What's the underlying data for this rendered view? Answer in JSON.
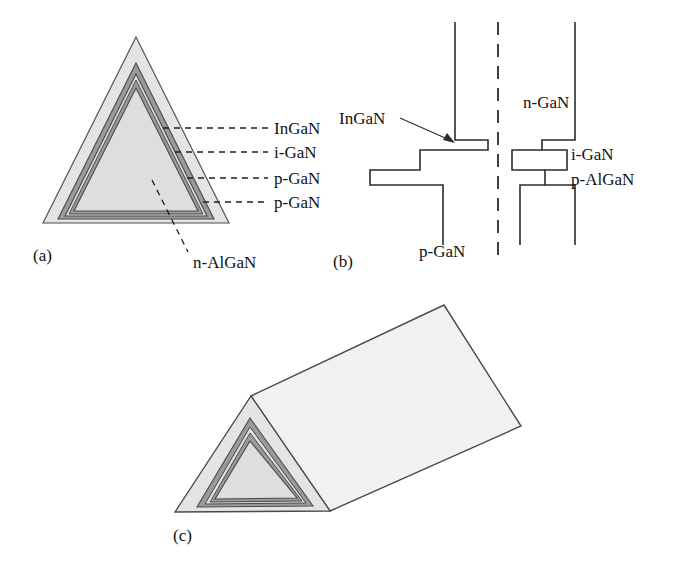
{
  "figure": {
    "background": "#ffffff",
    "colors": {
      "outline": "#3b3b3b",
      "light_gray": "#e2e2e2",
      "mid_gray": "#d2d2d2",
      "dark_gray": "#8f8f8f",
      "core_gray": "#dcdcdc",
      "text": "#121212",
      "prism_face": "#ededed",
      "prism_top": "#f0f0f0"
    }
  },
  "panels": [
    {
      "id": "a",
      "label": "(a)",
      "type": "nested-triangle-cross-section",
      "description": "Plan-view of concentric epitaxial layers on a triangular mesa",
      "layers": [
        {
          "name": "n-AlGaN",
          "shade": "light_gray"
        },
        {
          "name": "p-GaN",
          "shade": "dark_gray"
        },
        {
          "name": "p-GaN",
          "shade": "mid_gray"
        },
        {
          "name": "i-GaN",
          "shade": "light_gray"
        },
        {
          "name": "InGaN",
          "shade": "core_gray"
        }
      ],
      "callouts": [
        {
          "text": "InGaN",
          "leader": "dashed-horizontal"
        },
        {
          "text": "i-GaN",
          "leader": "dashed-horizontal"
        },
        {
          "text": "p-GaN",
          "leader": "dashed-horizontal"
        },
        {
          "text": "p-GaN",
          "leader": "dashed-horizontal"
        },
        {
          "text": "n-AlGaN",
          "leader": "dashed-diagonal"
        }
      ]
    },
    {
      "id": "b",
      "label": "(b)",
      "type": "stepped-cross-section",
      "description": "Mirror-symmetric stepped layer profile about a dash-dot centerline",
      "callouts": [
        {
          "text": "InGaN",
          "leader": "arrow",
          "side": "left"
        },
        {
          "text": "p-GaN",
          "leader": "none",
          "side": "left"
        },
        {
          "text": "n-GaN",
          "leader": "none",
          "side": "right"
        },
        {
          "text": "i-GaN",
          "leader": "none",
          "side": "right"
        },
        {
          "text": "p-AlGaN",
          "leader": "none",
          "side": "right"
        }
      ],
      "centerline": "dashed"
    },
    {
      "id": "c",
      "label": "(c)",
      "type": "triangular-prism-3d",
      "description": "Three-dimensional triangular prism showing the same concentric layers on the end face"
    }
  ]
}
